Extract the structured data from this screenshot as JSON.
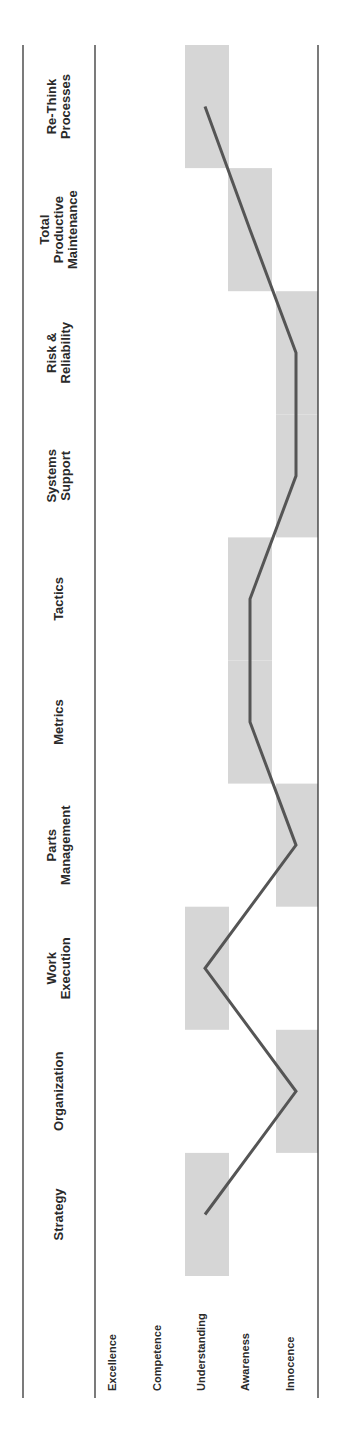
{
  "chart_data": {
    "type": "line",
    "orientation": "rotated-90-ccw",
    "title": "",
    "xlabel": "",
    "ylabel": "",
    "categories": [
      "Strategy",
      "Organization",
      "Work Execution",
      "Parts Management",
      "Metrics",
      "Tactics",
      "Systems Support",
      "Risk & Reliability",
      "Total Productive Maintenance",
      "Re-Think Processes"
    ],
    "category_label_lines": [
      [
        "Strategy"
      ],
      [
        "Organization"
      ],
      [
        "Work",
        "Execution"
      ],
      [
        "Parts",
        "Management"
      ],
      [
        "Metrics"
      ],
      [
        "Tactics"
      ],
      [
        "Systems",
        "Support"
      ],
      [
        "Risk &",
        "Reliability"
      ],
      [
        "Total",
        "Productive",
        "Maintenance"
      ],
      [
        "Re-Think",
        "Processes"
      ]
    ],
    "levels": [
      "Excellence",
      "Competence",
      "Understanding",
      "Awareness",
      "Innocence"
    ],
    "level_scale": {
      "Excellence": 5,
      "Competence": 4,
      "Understanding": 3,
      "Awareness": 2,
      "Innocence": 1
    },
    "series": [
      {
        "name": "Maturity level",
        "levels": [
          "Understanding",
          "Innocence",
          "Understanding",
          "Innocence",
          "Awareness",
          "Awareness",
          "Innocence",
          "Innocence",
          "Awareness",
          "Understanding"
        ],
        "values": [
          3,
          1,
          3,
          1,
          2,
          2,
          1,
          1,
          2,
          3
        ]
      }
    ],
    "ylim": [
      1,
      5
    ],
    "grid": false,
    "legend": "none",
    "highlight_boxes": "shaded band per category at its level",
    "colors": {
      "line": "#555555",
      "box": "#d6d6d6",
      "rule": "#333333"
    }
  }
}
